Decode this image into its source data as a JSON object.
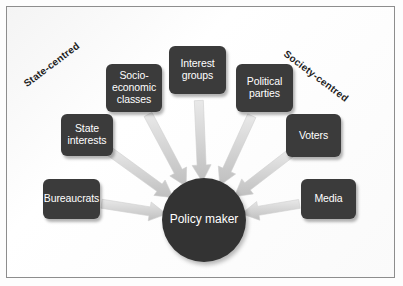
{
  "figure": {
    "type": "radial-convergence-diagram",
    "background_color": "#ffffff",
    "frame_color": "#8d8d8d",
    "node_color": "#3b3b3b",
    "node_text_color": "#ffffff",
    "hub_color": "#333333",
    "arrow_color": "#d8d8d8"
  },
  "hub": {
    "line1": "Policy",
    "line2": "maker",
    "center_x": 197,
    "center_y": 213,
    "radius": 42
  },
  "axis_labels": {
    "left": "State-centred",
    "right": "Society-centred"
  },
  "nodes": [
    {
      "id": "bureaucrats",
      "line1": "Bureaucrats",
      "line2": "",
      "line3": "",
      "x": 36,
      "y": 172,
      "w": 57,
      "h": 40
    },
    {
      "id": "state-interests",
      "line1": "State",
      "line2": "interests",
      "line3": "",
      "x": 54,
      "y": 107,
      "w": 52,
      "h": 42
    },
    {
      "id": "socio-economic-classes",
      "line1": "Socio-",
      "line2": "economic",
      "line3": "classes",
      "x": 99,
      "y": 57,
      "w": 56,
      "h": 48
    },
    {
      "id": "interest-groups",
      "line1": "Interest",
      "line2": "groups",
      "line3": "",
      "x": 162,
      "y": 39,
      "w": 57,
      "h": 48
    },
    {
      "id": "political-parties",
      "line1": "Political",
      "line2": "parties",
      "line3": "",
      "x": 229,
      "y": 57,
      "w": 57,
      "h": 48
    },
    {
      "id": "voters",
      "line1": "Voters",
      "line2": "",
      "line3": "",
      "x": 279,
      "y": 107,
      "w": 55,
      "h": 43
    },
    {
      "id": "media",
      "line1": "Media",
      "line2": "",
      "line3": "",
      "x": 294,
      "y": 172,
      "w": 55,
      "h": 40
    }
  ],
  "arrows": [
    {
      "from": "bureaucrats",
      "to": "hub",
      "angle_deg": 200
    },
    {
      "from": "state-interests",
      "to": "hub",
      "angle_deg": 218
    },
    {
      "from": "socio-economic-classes",
      "to": "hub",
      "angle_deg": 240
    },
    {
      "from": "interest-groups",
      "to": "hub",
      "angle_deg": 268
    },
    {
      "from": "political-parties",
      "to": "hub",
      "angle_deg": 296
    },
    {
      "from": "voters",
      "to": "hub",
      "angle_deg": 320
    },
    {
      "from": "media",
      "to": "hub",
      "angle_deg": 340
    }
  ]
}
